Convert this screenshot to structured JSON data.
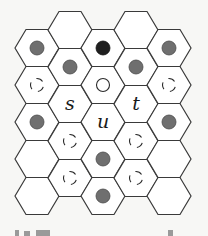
{
  "figure": {
    "colors": {
      "hex_fill": "#ffffff",
      "hex_stroke": "#3a3a3a",
      "gray_dot": "#6f6f6f",
      "black_dot": "#1f1f1f",
      "background": "#f7f7f5"
    },
    "columns": [
      {
        "index": 0,
        "cells": [
          {
            "row": 0,
            "mark": "gray-dot"
          },
          {
            "row": 1,
            "mark": "dashed-circle"
          },
          {
            "row": 2,
            "mark": "gray-dot"
          },
          {
            "row": 3,
            "mark": "none"
          },
          {
            "row": 4,
            "mark": "none"
          }
        ]
      },
      {
        "index": 1,
        "cells": [
          {
            "row": 0,
            "mark": "none"
          },
          {
            "row": 1,
            "mark": "gray-dot"
          },
          {
            "row": 2,
            "mark": "label",
            "label": "s"
          },
          {
            "row": 3,
            "mark": "dashed-circle"
          },
          {
            "row": 4,
            "mark": "dashed-circle"
          }
        ]
      },
      {
        "index": 2,
        "cells": [
          {
            "row": 0,
            "mark": "black-dot"
          },
          {
            "row": 1,
            "mark": "hollow-circle"
          },
          {
            "row": 2,
            "mark": "label",
            "label": "u"
          },
          {
            "row": 3,
            "mark": "gray-dot"
          },
          {
            "row": 4,
            "mark": "gray-dot"
          }
        ]
      },
      {
        "index": 3,
        "cells": [
          {
            "row": 0,
            "mark": "none"
          },
          {
            "row": 1,
            "mark": "gray-dot"
          },
          {
            "row": 2,
            "mark": "label",
            "label": "t"
          },
          {
            "row": 3,
            "mark": "dashed-circle"
          },
          {
            "row": 4,
            "mark": "dashed-circle"
          }
        ]
      },
      {
        "index": 4,
        "cells": [
          {
            "row": 0,
            "mark": "gray-dot"
          },
          {
            "row": 1,
            "mark": "dashed-circle"
          },
          {
            "row": 2,
            "mark": "gray-dot"
          },
          {
            "row": 3,
            "mark": "none"
          },
          {
            "row": 4,
            "mark": "none"
          }
        ]
      }
    ]
  }
}
